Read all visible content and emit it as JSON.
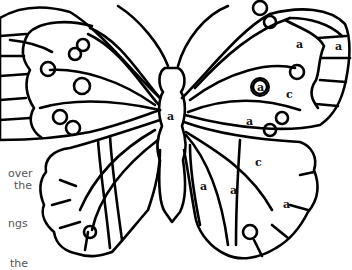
{
  "figure": {
    "stroke_color": "#000000",
    "background": "#ffffff"
  },
  "side_text": {
    "lines": [
      "over",
      "the",
      "ngs",
      "the"
    ]
  },
  "labels": {
    "body": "a",
    "right_forewing_top": "a",
    "right_forewing_edge": "a",
    "right_forewing_circle": "a",
    "right_forewing_mid": "c",
    "right_forewing_lower": "a",
    "right_hindwing_upper": "c",
    "right_hindwing_inner1": "a",
    "right_hindwing_inner2": "a",
    "right_hindwing_edge": "a"
  }
}
